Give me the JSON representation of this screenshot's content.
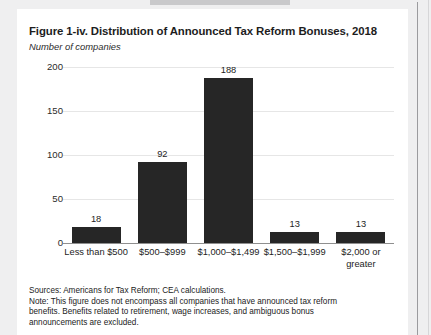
{
  "figure": {
    "title": "Figure 1-iv. Distribution of Announced Tax Reform Bonuses, 2018",
    "subtitle": "Number of companies",
    "notes": [
      "Sources: Americans for Tax Reform; CEA calculations.",
      "Note: This figure does not encompass all companies that have announced tax reform",
      "benefits. Benefits related to retirement, wage increases, and ambiguous bonus",
      "announcements are excluded."
    ]
  },
  "colors": {
    "bar": "#262626",
    "gridline": "#e6e6e6",
    "axis": "#8f8f8f",
    "card": "#ffffff",
    "page": "#efeff0"
  },
  "chart_data": {
    "type": "bar",
    "title": "Figure 1-iv. Distribution of Announced Tax Reform Bonuses, 2018",
    "subtitle": "Number of companies",
    "xlabel": "",
    "ylabel": "Number of companies",
    "ylim": [
      0,
      200
    ],
    "yticks": [
      0,
      50,
      100,
      150,
      200
    ],
    "ytick_labels": [
      "0",
      "50",
      "100",
      "150",
      "200"
    ],
    "grid": true,
    "legend": false,
    "categories": [
      "Less than $500",
      "$500–$999",
      "$1,000–$1,499",
      "$1,500–$1,999",
      "$2,000 or greater"
    ],
    "category_lines": [
      [
        "Less than $500"
      ],
      [
        "$500–$999"
      ],
      [
        "$1,000–$1,499"
      ],
      [
        "$1,500–$1,999"
      ],
      [
        "$2,000 or",
        "greater"
      ]
    ],
    "values": [
      18,
      92,
      188,
      13,
      13
    ],
    "value_labels": [
      "18",
      "92",
      "188",
      "13",
      "13"
    ]
  }
}
